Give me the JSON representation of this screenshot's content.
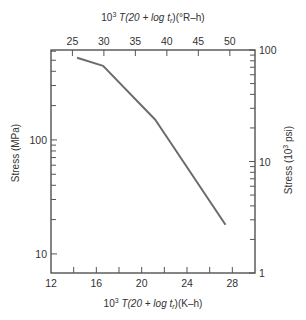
{
  "chart_data": {
    "type": "line",
    "title": "",
    "xlabel": "10^3 T(20 + log t_r)(K–h)",
    "xlabel_top": "10^3 T(20 + log t_r)(°R–h)",
    "ylabel": "Stress (MPa)",
    "ylabel_right": "Stress (10^3 psi)",
    "x_scale": "linear",
    "y_scale": "log",
    "xlim": [
      12,
      30
    ],
    "ylim": [
      6.8,
      615
    ],
    "xlim_top": [
      21.6,
      54
    ],
    "ylim_right": [
      1,
      100
    ],
    "x_ticks": [
      12,
      16,
      20,
      24,
      28
    ],
    "x_minor_ticks": [
      14,
      18,
      22,
      26
    ],
    "x_ticks_top": [
      25,
      30,
      35,
      40,
      45,
      50
    ],
    "y_ticks": [
      10,
      100
    ],
    "y_minor_ticks": [
      20,
      30,
      40,
      50,
      60,
      70,
      80,
      90,
      200,
      300,
      400,
      500,
      600
    ],
    "y_ticks_right": [
      1,
      10,
      100
    ],
    "y_minor_ticks_right": [
      2,
      3,
      4,
      5,
      6,
      7,
      8,
      9,
      20,
      30,
      40,
      50,
      60,
      70,
      80,
      90
    ],
    "grid": false,
    "legend": null,
    "series": [
      {
        "name": "Stress vs Larson-Miller parameter",
        "color": "#6b6b6b",
        "x": [
          14.3,
          16.6,
          21.2,
          27.4
        ],
        "y": [
          525,
          446,
          150,
          18
        ]
      }
    ]
  },
  "labels": {
    "top_axis_title_prefix": "10",
    "top_axis_title_sup": "3",
    "top_axis_title_rest": " T(20 + log t",
    "top_axis_title_sub": "r",
    "top_axis_title_unit": ")(°R–h)",
    "bottom_axis_title_prefix": "10",
    "bottom_axis_title_sup": "3",
    "bottom_axis_title_rest": " T(20 + log t",
    "bottom_axis_title_sub": "r",
    "bottom_axis_title_unit": ")(K–h)",
    "left_axis_title": "Stress (MPa)",
    "right_axis_title_prefix": "Stress (10",
    "right_axis_title_sup": "3",
    "right_axis_title_unit": " psi)"
  }
}
